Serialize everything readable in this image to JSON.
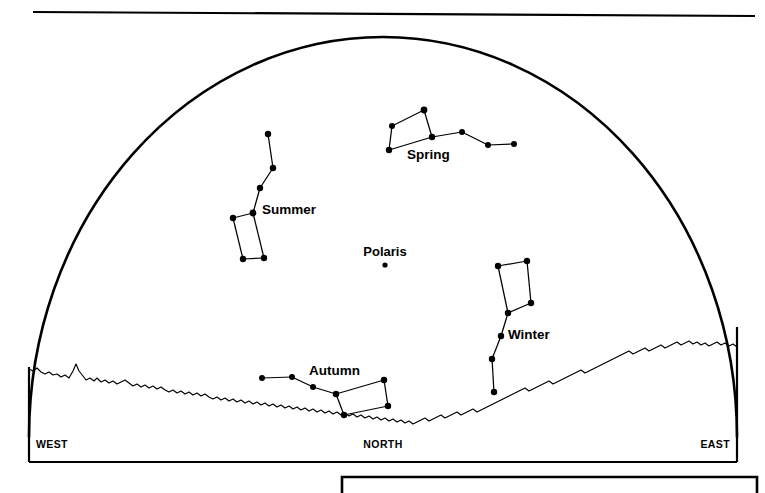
{
  "figure": {
    "title_visible": false,
    "kind": "star-chart-dome",
    "ink_color": "#000000",
    "background_color": "#ffffff"
  },
  "directions": {
    "west": "WEST",
    "north": "NORTH",
    "east": "EAST"
  },
  "pole_star": {
    "label": "Polaris",
    "label_x": 360,
    "label_y": 256,
    "star_x": 385,
    "star_y": 265,
    "star_r": 2.6
  },
  "constellations": [
    {
      "name": "Spring",
      "label": "Spring",
      "label_x": 407,
      "label_y": 159,
      "stars": [
        {
          "x": 392,
          "y": 126,
          "r": 3.0
        },
        {
          "x": 424,
          "y": 110,
          "r": 3.4
        },
        {
          "x": 389,
          "y": 150,
          "r": 3.2
        },
        {
          "x": 432,
          "y": 137,
          "r": 3.2
        },
        {
          "x": 462,
          "y": 132,
          "r": 3.0
        },
        {
          "x": 488,
          "y": 145,
          "r": 3.0
        },
        {
          "x": 514,
          "y": 144,
          "r": 3.0
        }
      ],
      "links": [
        [
          0,
          1
        ],
        [
          1,
          3
        ],
        [
          3,
          2
        ],
        [
          2,
          0
        ],
        [
          3,
          4
        ],
        [
          4,
          5
        ],
        [
          5,
          6
        ]
      ]
    },
    {
      "name": "Summer",
      "label": "Summer",
      "label_x": 262,
      "label_y": 214,
      "stars": [
        {
          "x": 268,
          "y": 134,
          "r": 3.2
        },
        {
          "x": 273,
          "y": 168,
          "r": 3.2
        },
        {
          "x": 260,
          "y": 188,
          "r": 3.2
        },
        {
          "x": 253,
          "y": 213,
          "r": 3.4
        },
        {
          "x": 233,
          "y": 218,
          "r": 3.2
        },
        {
          "x": 243,
          "y": 259,
          "r": 3.2
        },
        {
          "x": 264,
          "y": 258,
          "r": 3.2
        }
      ],
      "links": [
        [
          0,
          1
        ],
        [
          1,
          2
        ],
        [
          2,
          3
        ],
        [
          3,
          4
        ],
        [
          4,
          5
        ],
        [
          5,
          6
        ],
        [
          6,
          3
        ]
      ]
    },
    {
      "name": "Winter",
      "label": "Winter",
      "label_x": 508,
      "label_y": 339,
      "stars": [
        {
          "x": 498,
          "y": 266,
          "r": 3.2
        },
        {
          "x": 527,
          "y": 261,
          "r": 3.2
        },
        {
          "x": 531,
          "y": 303,
          "r": 3.2
        },
        {
          "x": 508,
          "y": 313,
          "r": 3.2
        },
        {
          "x": 501,
          "y": 336,
          "r": 3.2
        },
        {
          "x": 492,
          "y": 359,
          "r": 3.2
        },
        {
          "x": 494,
          "y": 392,
          "r": 3.2
        }
      ],
      "links": [
        [
          0,
          1
        ],
        [
          1,
          2
        ],
        [
          2,
          3
        ],
        [
          3,
          0
        ],
        [
          3,
          4
        ],
        [
          4,
          5
        ],
        [
          5,
          6
        ]
      ]
    },
    {
      "name": "Autumn",
      "label": "Autumn",
      "label_x": 309,
      "label_y": 375,
      "stars": [
        {
          "x": 262,
          "y": 378,
          "r": 3.0
        },
        {
          "x": 292,
          "y": 377,
          "r": 3.0
        },
        {
          "x": 313,
          "y": 387,
          "r": 3.0
        },
        {
          "x": 336,
          "y": 394,
          "r": 3.2
        },
        {
          "x": 384,
          "y": 380,
          "r": 3.2
        },
        {
          "x": 388,
          "y": 406,
          "r": 3.2
        },
        {
          "x": 344,
          "y": 415,
          "r": 3.2
        }
      ],
      "links": [
        [
          0,
          1
        ],
        [
          1,
          2
        ],
        [
          2,
          3
        ],
        [
          3,
          4
        ],
        [
          4,
          5
        ],
        [
          5,
          6
        ],
        [
          6,
          3
        ]
      ]
    }
  ],
  "dome": {
    "left_x": 29,
    "right_x": 737,
    "base_y": 437,
    "apex_y": 37
  },
  "frame": {
    "top_rule_y": 12,
    "top_rule_x1": 33,
    "top_rule_x2": 755,
    "box_left": 29,
    "box_right": 737,
    "box_bottom": 462
  },
  "second_panel": {
    "left": 342,
    "top": 477,
    "right": 757
  },
  "horizon": {
    "description": "jagged mountain-silhouette horizon from west to east",
    "points": "29,369 33,371 37,368 41,372 45,374 49,372 53,375 57,374 61,377 65,375 69,378 73,371 76,364 79,371 83,376 86,380 90,378 94,381 97,378 101,382 105,380 109,383 113,381 117,384 121,382 125,380 129,383 133,386 137,384 141,387 145,385 149,388 153,386 157,389 161,387 165,390 169,392 173,390 177,393 181,391 185,394 189,392 193,395 197,393 201,396 205,394 209,397 213,399 217,397 221,400 225,398 229,401 233,399 237,402 241,400 245,403 249,401 253,404 257,402 261,405 265,403 269,406 273,404 277,407 281,405 285,408 289,406 293,409 297,407 301,410 305,408 309,411 313,409 317,412 321,410 325,413 329,411 333,414 337,412 341,415 345,413 349,416 353,414 357,417 361,415 365,418 369,416 373,419 377,417 381,420 385,418 389,421 393,419 397,422 401,420 405,423 409,421 413,424 417,422 421,420 425,418 429,421 433,419 437,417 441,415 445,418 449,416 453,414 457,412 461,415 465,413 469,411 473,409 477,412 481,410 485,408 489,406 493,404 497,402 501,400 505,398 509,396 513,394 517,392 521,390 525,388 529,391 533,389 537,387 541,385 545,383 549,381 553,384 557,382 561,380 565,378 569,376 573,374 577,372 581,370 585,373 589,371 593,369 597,367 601,365 605,363 609,361 613,359 617,357 621,355 625,353 629,351 633,354 637,352 641,350 645,348 649,351 653,349 657,347 661,345 665,348 669,346 673,344 677,342 681,345 685,343 689,341 693,344 697,342 701,345 705,343 709,346 713,344 717,342 721,345 725,343 729,346 733,344 737,347"
  }
}
